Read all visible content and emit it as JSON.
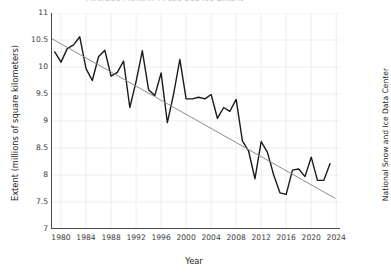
{
  "chart_data": {
    "type": "line",
    "title": "Average Monthly Arctic Sea Ice Extent",
    "xlabel": "Year",
    "ylabel": "Extent (millions of square kilometers)",
    "credit": "National Snow and Ice Data Center",
    "xlim": [
      1978.4,
      2024.6
    ],
    "ylim": [
      7,
      11
    ],
    "xticks": [
      1980,
      1984,
      1988,
      1992,
      1996,
      2000,
      2004,
      2008,
      2012,
      2016,
      2020,
      2024
    ],
    "yticks": [
      7,
      7.5,
      8,
      8.5,
      9,
      9.5,
      10,
      10.5,
      11
    ],
    "ytick_labels": [
      "7",
      "7.5",
      "8",
      "8.5",
      "9",
      "9.5",
      "10",
      "10.5",
      "11"
    ],
    "grid": true,
    "grid_color": "#e8e8ee",
    "legend": "none",
    "series": [
      {
        "name": "Sea ice extent",
        "color": "#1a1a1a",
        "line_width": 1.4,
        "x": [
          1979,
          1980,
          1981,
          1982,
          1983,
          1984,
          1985,
          1986,
          1987,
          1988,
          1989,
          1990,
          1991,
          1992,
          1993,
          1994,
          1995,
          1996,
          1997,
          1998,
          1999,
          2000,
          2001,
          2002,
          2003,
          2004,
          2005,
          2006,
          2007,
          2008,
          2009,
          2010,
          2011,
          2012,
          2013,
          2014,
          2015,
          2016,
          2017,
          2018,
          2019,
          2020,
          2021,
          2022,
          2023
        ],
        "values": [
          10.28,
          10.09,
          10.34,
          10.41,
          10.56,
          9.97,
          9.75,
          10.19,
          10.31,
          9.83,
          9.9,
          10.11,
          9.25,
          9.73,
          10.3,
          9.58,
          9.47,
          9.89,
          8.97,
          9.5,
          10.14,
          9.41,
          9.41,
          9.44,
          9.41,
          9.49,
          9.05,
          9.25,
          9.18,
          9.4,
          8.63,
          8.44,
          7.93,
          8.62,
          8.42,
          8.0,
          7.67,
          7.64,
          8.09,
          8.11,
          7.97,
          8.33,
          7.9,
          7.9,
          8.21
        ],
        "extra_points": [
          {
            "x": 2020,
            "y": 7.26
          },
          {
            "x": 2022,
            "y": 8.25
          },
          {
            "x": 2023,
            "y": 8.14
          }
        ]
      },
      {
        "name": "Linear trend",
        "color": "#8c8c8c",
        "line_width": 1.0,
        "x": [
          1978.6,
          2023.8
        ],
        "values": [
          10.52,
          7.57
        ]
      }
    ]
  },
  "axes": {
    "spine_color": "#4a4a4a",
    "tick_color": "#3b3b3b",
    "background": "#ffffff"
  }
}
